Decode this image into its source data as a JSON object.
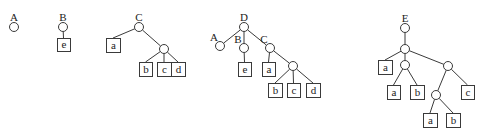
{
  "diagram": {
    "type": "tree-forest",
    "trees": [
      {
        "label": "A",
        "nodes": [
          {
            "id": "A0",
            "x": 14,
            "y": 27
          }
        ],
        "edges": [],
        "leaves": []
      },
      {
        "label": "B",
        "nodes": [
          {
            "id": "B0",
            "x": 63,
            "y": 27
          }
        ],
        "edges": [
          [
            "B0",
            "Be"
          ]
        ],
        "leaves": [
          {
            "id": "Be",
            "label": "e",
            "x": 57,
            "y": 38,
            "w": 13,
            "h": 13
          }
        ]
      },
      {
        "label": "C",
        "nodes": [
          {
            "id": "C0",
            "x": 139,
            "y": 27
          },
          {
            "id": "C1",
            "x": 164,
            "y": 49
          }
        ],
        "edges": [
          [
            "C0",
            "Ca"
          ],
          [
            "C0",
            "C1"
          ],
          [
            "C1",
            "Cb"
          ],
          [
            "C1",
            "Cc"
          ],
          [
            "C1",
            "Cd"
          ]
        ],
        "leaves": [
          {
            "id": "Ca",
            "label": "a",
            "x": 106,
            "y": 38,
            "w": 14,
            "h": 14
          },
          {
            "id": "Cb",
            "label": "b",
            "x": 139,
            "y": 62,
            "w": 13,
            "h": 14
          },
          {
            "id": "Cc",
            "label": "c",
            "x": 157,
            "y": 62,
            "w": 14,
            "h": 14
          },
          {
            "id": "Cd",
            "label": "d",
            "x": 171,
            "y": 62,
            "w": 14,
            "h": 14
          }
        ]
      },
      {
        "label": "D",
        "nodes": [
          {
            "id": "D0",
            "x": 244,
            "y": 27
          },
          {
            "id": "DA",
            "x": 220,
            "y": 46,
            "label": "A"
          },
          {
            "id": "DB",
            "x": 244,
            "y": 48,
            "label": "B"
          },
          {
            "id": "DC",
            "x": 270,
            "y": 48,
            "label": "C"
          },
          {
            "id": "DC1",
            "x": 293,
            "y": 66
          }
        ],
        "edges": [
          [
            "D0",
            "DA"
          ],
          [
            "D0",
            "DB"
          ],
          [
            "D0",
            "DC"
          ],
          [
            "DB",
            "De"
          ],
          [
            "DC",
            "Da"
          ],
          [
            "DC",
            "DC1"
          ],
          [
            "DC1",
            "Db"
          ],
          [
            "DC1",
            "Dc"
          ],
          [
            "DC1",
            "Dd"
          ]
        ],
        "leaves": [
          {
            "id": "De",
            "label": "e",
            "x": 238,
            "y": 62,
            "w": 13,
            "h": 14
          },
          {
            "id": "Da",
            "label": "a",
            "x": 262,
            "y": 62,
            "w": 13,
            "h": 14
          },
          {
            "id": "Db",
            "label": "b",
            "x": 268,
            "y": 83,
            "w": 14,
            "h": 14
          },
          {
            "id": "Dc",
            "label": "c",
            "x": 287,
            "y": 83,
            "w": 13,
            "h": 14
          },
          {
            "id": "Dd",
            "label": "d",
            "x": 306,
            "y": 83,
            "w": 14,
            "h": 14
          }
        ]
      },
      {
        "label": "E",
        "nodes": [
          {
            "id": "E0",
            "x": 405,
            "y": 28
          },
          {
            "id": "E1",
            "x": 405,
            "y": 49
          },
          {
            "id": "E2",
            "x": 405,
            "y": 65
          },
          {
            "id": "E3",
            "x": 448,
            "y": 66
          },
          {
            "id": "E4",
            "x": 436,
            "y": 95
          }
        ],
        "edges": [
          [
            "E0",
            "E1"
          ],
          [
            "E1",
            "Ea1"
          ],
          [
            "E1",
            "E2"
          ],
          [
            "E1",
            "E3"
          ],
          [
            "E2",
            "Ea2"
          ],
          [
            "E2",
            "Eb2"
          ],
          [
            "E3",
            "E4"
          ],
          [
            "E3",
            "Ec"
          ],
          [
            "E4",
            "Ea3"
          ],
          [
            "E4",
            "Eb3"
          ]
        ],
        "leaves": [
          {
            "id": "Ea1",
            "label": "a",
            "x": 378,
            "y": 60,
            "w": 14,
            "h": 14
          },
          {
            "id": "Ea2",
            "label": "a",
            "x": 387,
            "y": 85,
            "w": 13,
            "h": 14
          },
          {
            "id": "Eb2",
            "label": "b",
            "x": 410,
            "y": 85,
            "w": 14,
            "h": 14
          },
          {
            "id": "Ec",
            "label": "c",
            "x": 461,
            "y": 85,
            "w": 13,
            "h": 14
          },
          {
            "id": "Ea3",
            "label": "a",
            "x": 423,
            "y": 113,
            "w": 14,
            "h": 14
          },
          {
            "id": "Eb3",
            "label": "b",
            "x": 446,
            "y": 113,
            "w": 14,
            "h": 14
          }
        ]
      }
    ],
    "colors": {
      "stroke": "#3a3a3a",
      "text": "#222222",
      "background": "#ffffff"
    }
  }
}
